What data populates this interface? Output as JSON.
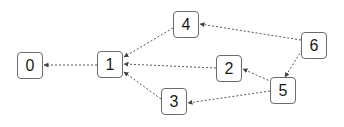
{
  "diagram": {
    "type": "directed-graph",
    "nodes": [
      {
        "id": "0",
        "label": "0",
        "x": 17,
        "y": 52,
        "w": 26,
        "h": 27
      },
      {
        "id": "1",
        "label": "1",
        "x": 97,
        "y": 51,
        "w": 26,
        "h": 27
      },
      {
        "id": "2",
        "label": "2",
        "x": 216,
        "y": 55,
        "w": 26,
        "h": 27
      },
      {
        "id": "3",
        "label": "3",
        "x": 161,
        "y": 88,
        "w": 26,
        "h": 27
      },
      {
        "id": "4",
        "label": "4",
        "x": 173,
        "y": 11,
        "w": 26,
        "h": 27
      },
      {
        "id": "5",
        "label": "5",
        "x": 270,
        "y": 77,
        "w": 26,
        "h": 27
      },
      {
        "id": "6",
        "label": "6",
        "x": 301,
        "y": 32,
        "w": 26,
        "h": 27
      }
    ],
    "edges": [
      {
        "from": "1",
        "to": "0",
        "x1": 97,
        "y1": 65,
        "x2": 44,
        "y2": 65
      },
      {
        "from": "2",
        "to": "1",
        "x1": 216,
        "y1": 68,
        "x2": 124,
        "y2": 64
      },
      {
        "from": "3",
        "to": "1",
        "x1": 161,
        "y1": 99,
        "x2": 124,
        "y2": 72
      },
      {
        "from": "4",
        "to": "1",
        "x1": 173,
        "y1": 28,
        "x2": 124,
        "y2": 57
      },
      {
        "from": "5",
        "to": "2",
        "x1": 272,
        "y1": 82,
        "x2": 243,
        "y2": 69
      },
      {
        "from": "5",
        "to": "3",
        "x1": 270,
        "y1": 91,
        "x2": 188,
        "y2": 103
      },
      {
        "from": "6",
        "to": "4",
        "x1": 301,
        "y1": 40,
        "x2": 200,
        "y2": 24
      },
      {
        "from": "6",
        "to": "5",
        "x1": 302,
        "y1": 50,
        "x2": 285,
        "y2": 77
      }
    ],
    "colors": {
      "edge": "#555555",
      "node_border": "#6b6b6b",
      "text": "#1a1a1a"
    }
  }
}
